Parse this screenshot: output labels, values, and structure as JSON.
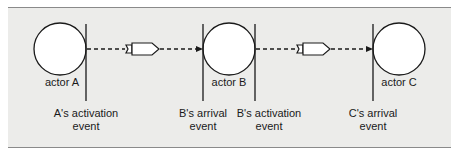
{
  "diagram": {
    "actors": [
      {
        "label": "actor A"
      },
      {
        "label": "actor B"
      },
      {
        "label": "actor C"
      }
    ],
    "events": [
      {
        "line1": "A's activation",
        "line2": "event"
      },
      {
        "line1": "B's arrival",
        "line2": "event"
      },
      {
        "line1": "B's activation",
        "line2": "event"
      },
      {
        "line1": "C's arrival",
        "line2": "event"
      }
    ],
    "colors": {
      "background": "#ececea",
      "stroke": "#1a1a1a",
      "fill": "#ffffff"
    }
  }
}
